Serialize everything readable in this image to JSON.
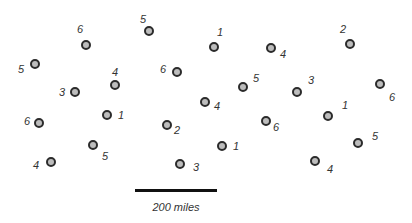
{
  "colors": {
    "dot_fill": "#bdbdbd",
    "dot_border": "#2b2b2b",
    "label": "#333333",
    "scale_bar": "#111111"
  },
  "points": [
    {
      "dot": [
        86,
        45
      ],
      "label": "6",
      "label_pos": [
        80,
        29
      ]
    },
    {
      "dot": [
        149,
        31
      ],
      "label": "5",
      "label_pos": [
        143,
        19
      ]
    },
    {
      "dot": [
        214,
        47
      ],
      "label": "1",
      "label_pos": [
        220,
        32
      ]
    },
    {
      "dot": [
        271,
        48
      ],
      "label": "4",
      "label_pos": [
        283,
        54
      ]
    },
    {
      "dot": [
        350,
        44
      ],
      "label": "2",
      "label_pos": [
        343,
        29
      ]
    },
    {
      "dot": [
        35,
        64
      ],
      "label": "5",
      "label_pos": [
        21,
        69
      ]
    },
    {
      "dot": [
        115,
        85
      ],
      "label": "4",
      "label_pos": [
        115,
        72
      ]
    },
    {
      "dot": [
        177,
        72
      ],
      "label": "6",
      "label_pos": [
        163,
        69
      ]
    },
    {
      "dot": [
        75,
        92
      ],
      "label": "3",
      "label_pos": [
        62,
        92
      ]
    },
    {
      "dot": [
        243,
        87
      ],
      "label": "5",
      "label_pos": [
        256,
        78
      ]
    },
    {
      "dot": [
        297,
        92
      ],
      "label": "3",
      "label_pos": [
        311,
        80
      ]
    },
    {
      "dot": [
        380,
        84
      ],
      "label": "6",
      "label_pos": [
        392,
        97
      ]
    },
    {
      "dot": [
        205,
        102
      ],
      "label": "4",
      "label_pos": [
        217,
        106
      ]
    },
    {
      "dot": [
        39,
        123
      ],
      "label": "6",
      "label_pos": [
        27,
        121
      ]
    },
    {
      "dot": [
        107,
        115
      ],
      "label": "1",
      "label_pos": [
        121,
        115
      ]
    },
    {
      "dot": [
        328,
        116
      ],
      "label": "1",
      "label_pos": [
        345,
        105
      ]
    },
    {
      "dot": [
        167,
        125
      ],
      "label": "2",
      "label_pos": [
        177,
        130
      ]
    },
    {
      "dot": [
        266,
        121
      ],
      "label": "6",
      "label_pos": [
        276,
        127
      ]
    },
    {
      "dot": [
        93,
        145
      ],
      "label": "5",
      "label_pos": [
        105,
        156
      ]
    },
    {
      "dot": [
        222,
        146
      ],
      "label": "1",
      "label_pos": [
        236,
        146
      ]
    },
    {
      "dot": [
        358,
        143
      ],
      "label": "5",
      "label_pos": [
        375,
        136
      ]
    },
    {
      "dot": [
        51,
        162
      ],
      "label": "4",
      "label_pos": [
        36,
        165
      ]
    },
    {
      "dot": [
        180,
        164
      ],
      "label": "3",
      "label_pos": [
        196,
        167
      ]
    },
    {
      "dot": [
        315,
        161
      ],
      "label": "4",
      "label_pos": [
        330,
        169
      ]
    }
  ],
  "scale": {
    "label": "200 miles"
  }
}
